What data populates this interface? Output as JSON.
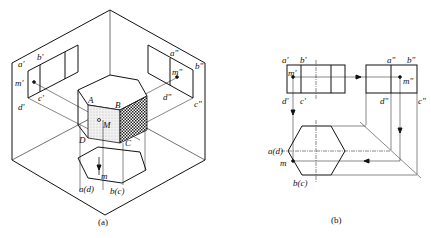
{
  "figure_a": {
    "caption": "(a)",
    "labels": {
      "a_prime": "a'",
      "b_prime": "b'",
      "m_prime": "m'",
      "c_prime": "c'",
      "d_prime": "d'",
      "a_dprime": "a\"",
      "b_dprime": "b\"",
      "m_dprime": "m\"",
      "c_dprime": "c\"",
      "d_dprime": "d\"",
      "A": "A",
      "B": "B",
      "C": "C",
      "D": "D",
      "M": "M",
      "m": "m",
      "ad": "a(d)",
      "bc": "b(c)"
    }
  },
  "figure_b": {
    "caption": "(b)",
    "labels": {
      "a_prime": "a'",
      "b_prime": "b'",
      "m_prime": "m'",
      "c_prime": "c'",
      "d_prime": "d'",
      "a_dprime": "a\"",
      "b_dprime": "b\"",
      "m_dprime": "m\"",
      "c_dprime": "c\"",
      "d_dprime": "d\"",
      "ad": "a(d)",
      "m": "m",
      "bc": "b(c)"
    }
  },
  "colors": {
    "line": "#111111",
    "thin": "#444444",
    "background": "#ffffff"
  }
}
